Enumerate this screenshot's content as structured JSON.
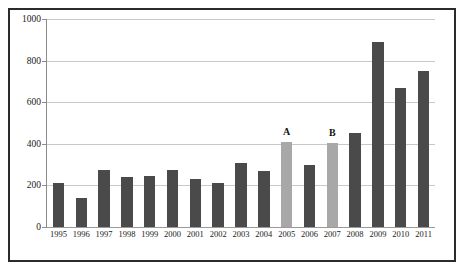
{
  "chart_data": {
    "type": "bar",
    "title": "",
    "subtitle": "",
    "xlabel": "",
    "ylabel": "",
    "categories": [
      "1995",
      "1996",
      "1997",
      "1998",
      "1999",
      "2000",
      "2001",
      "2002",
      "2003",
      "2004",
      "2005",
      "2006",
      "2007",
      "2008",
      "2009",
      "2010",
      "2011"
    ],
    "values": [
      210,
      140,
      275,
      240,
      245,
      275,
      230,
      210,
      310,
      270,
      410,
      300,
      405,
      450,
      890,
      670,
      750
    ],
    "bar_colors": [
      "#4a4a4a",
      "#4a4a4a",
      "#4a4a4a",
      "#4a4a4a",
      "#4a4a4a",
      "#4a4a4a",
      "#4a4a4a",
      "#4a4a4a",
      "#4a4a4a",
      "#4a4a4a",
      "#a8a8a8",
      "#4a4a4a",
      "#a8a8a8",
      "#4a4a4a",
      "#4a4a4a",
      "#4a4a4a",
      "#4a4a4a"
    ],
    "point_annotations": [
      "",
      "",
      "",
      "",
      "",
      "",
      "",
      "",
      "",
      "",
      "A",
      "",
      "B",
      "",
      "",
      "",
      ""
    ],
    "ylim": [
      0,
      1000
    ],
    "yticks": [
      0,
      200,
      400,
      600,
      800,
      1000
    ],
    "ytick_labels": [
      "0",
      "200",
      "400",
      "600",
      "800",
      "1000"
    ],
    "grid": true,
    "grid_axis": "y",
    "legend": false,
    "legend_position": "none",
    "series": [
      {
        "name": "",
        "values": [
          210,
          140,
          275,
          240,
          245,
          275,
          230,
          210,
          310,
          270,
          410,
          300,
          405,
          450,
          890,
          670,
          750
        ]
      }
    ]
  },
  "style": {
    "background_color": "#ffffff",
    "frame_color": "#2b2b2b",
    "gridline_color": "#c8c8c8",
    "axis_color": "#8c8c8c",
    "bar_color_default": "#4a4a4a",
    "bar_color_highlight": "#a8a8a8",
    "text_color": "#1a1a1a"
  }
}
